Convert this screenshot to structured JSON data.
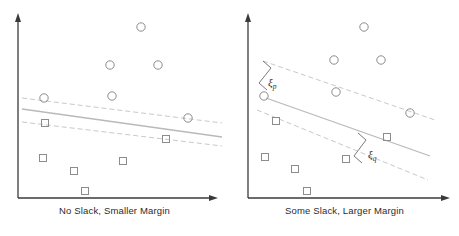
{
  "figure": {
    "background_color": "#ffffff"
  },
  "style": {
    "axis_color": "#3a3a3a",
    "boundary_color": "#b9b9b9",
    "margin_color": "#c9c9c9",
    "circle_color": "#8c8c8c",
    "square_color": "#8c8c8c",
    "slack_color": "#7a7a7a",
    "caption_color": "#2b2b2b"
  },
  "panels": [
    {
      "id": "left",
      "caption": "No Slack, Smaller Margin",
      "axes": {
        "x_axis_label": "",
        "y_axis_label": "",
        "origin_x": 18,
        "origin_y": 198,
        "x_axis_end": 218,
        "y_axis_end": 14
      },
      "boundary": {
        "x1": 22,
        "y1": 109,
        "x2": 222,
        "y2": 137
      },
      "margin_upper": {
        "x1": 22,
        "y1": 98,
        "x2": 222,
        "y2": 123
      },
      "margin_lower": {
        "x1": 22,
        "y1": 122,
        "x2": 222,
        "y2": 146
      },
      "circles": [
        {
          "cx": 141,
          "cy": 27
        },
        {
          "cx": 110,
          "cy": 65
        },
        {
          "cx": 158,
          "cy": 65
        },
        {
          "cx": 44,
          "cy": 98
        },
        {
          "cx": 112,
          "cy": 96
        },
        {
          "cx": 188,
          "cy": 118
        }
      ],
      "squares": [
        {
          "cx": 46,
          "cy": 124
        },
        {
          "cx": 167,
          "cy": 140
        },
        {
          "cx": 44,
          "cy": 159
        },
        {
          "cx": 75,
          "cy": 172
        },
        {
          "cx": 124,
          "cy": 162
        },
        {
          "cx": 86,
          "cy": 192
        }
      ],
      "slack_annotations": []
    },
    {
      "id": "right",
      "caption": "Some Slack, Larger Margin",
      "axes": {
        "x_axis_label": "",
        "y_axis_label": "",
        "origin_x": 18,
        "origin_y": 198,
        "x_axis_end": 220,
        "y_axis_end": 14
      },
      "boundary": {
        "x1": 36,
        "y1": 98,
        "x2": 200,
        "y2": 156
      },
      "margin_upper": {
        "x1": 33,
        "y1": 61,
        "x2": 205,
        "y2": 120
      },
      "margin_lower": {
        "x1": 27,
        "y1": 110,
        "x2": 198,
        "y2": 180
      },
      "circles": [
        {
          "cx": 134,
          "cy": 27
        },
        {
          "cx": 104,
          "cy": 60
        },
        {
          "cx": 151,
          "cy": 60
        },
        {
          "cx": 34,
          "cy": 96
        },
        {
          "cx": 106,
          "cy": 92
        },
        {
          "cx": 180,
          "cy": 113
        }
      ],
      "squares": [
        {
          "cx": 46,
          "cy": 121
        },
        {
          "cx": 157,
          "cy": 138
        },
        {
          "cx": 35,
          "cy": 157
        },
        {
          "cx": 65,
          "cy": 169
        },
        {
          "cx": 116,
          "cy": 159
        },
        {
          "cx": 77,
          "cy": 192
        }
      ],
      "slack_annotations": [
        {
          "name": "xi-p",
          "label": "ξ",
          "subscript": "p",
          "bracket": "M 33 61 L 41 68 L 29 83 L 37 90",
          "label_x": 38,
          "label_y": 76
        },
        {
          "name": "xi-q",
          "label": "ξ",
          "subscript": "q",
          "bracket": "M 128 133 L 136 140 L 124 156 L 132 163",
          "label_x": 138,
          "label_y": 148
        }
      ]
    }
  ]
}
